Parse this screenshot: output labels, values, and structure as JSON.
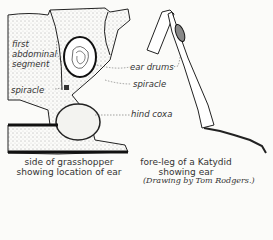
{
  "figure": {
    "left_panel": {
      "labels": {
        "first_segment": [
          "first",
          "abdominal",
          "segment"
        ],
        "spiracle": "spiracle"
      },
      "caption": [
        "side of grasshopper",
        "showing location of ear"
      ]
    },
    "shared_labels": {
      "ear_drums": "ear drums",
      "spiracle": "spiracle",
      "hind_coxa": "hind coxa"
    },
    "right_panel": {
      "caption": [
        "fore-leg of a Katydid",
        "showing ear"
      ]
    },
    "credit": "(Drawing by Tom Rodgers.)"
  }
}
